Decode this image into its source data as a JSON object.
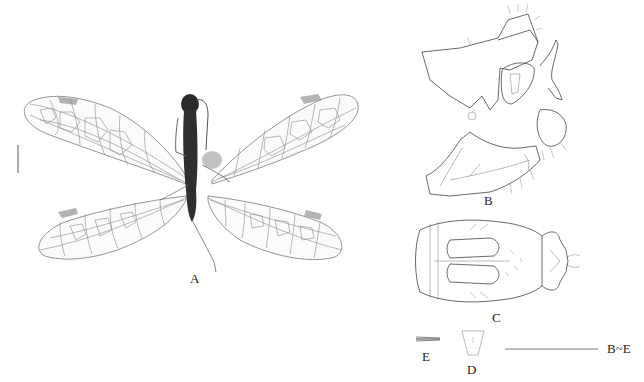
{
  "figure": {
    "panels": [
      {
        "id": "A",
        "label": "A",
        "description": "Adult habitus, dorsal view (wings spread)"
      },
      {
        "id": "B",
        "label": "B",
        "description": "Male genitalia, lateral view"
      },
      {
        "id": "C",
        "label": "C",
        "description": "Male genitalia, ventral view"
      },
      {
        "id": "D",
        "label": "D",
        "description": "Structure D"
      },
      {
        "id": "E",
        "label": "E",
        "description": "Structure E"
      }
    ],
    "scale_bars": [
      {
        "id": "scale-A",
        "orientation": "vertical",
        "applies_to": "A",
        "label": ""
      },
      {
        "id": "scale-BE",
        "orientation": "horizontal",
        "applies_to": "B~E",
        "label": "B~E"
      }
    ],
    "colors": {
      "background": "#ffffff",
      "line": "#444444",
      "vein": "#8a8a8a",
      "body": "#2a2a2a",
      "stigma": "#9a9a9a"
    }
  }
}
